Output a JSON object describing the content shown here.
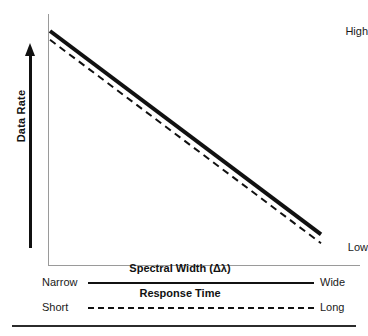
{
  "chart_data": {
    "type": "line",
    "title": "",
    "xlabel": "Spectral Width (Δλ)",
    "ylabel": "Data Rate",
    "grid": false,
    "legend": "none",
    "xlim": [
      0,
      1
    ],
    "ylim": [
      0,
      1
    ],
    "x_tick_labels": [
      "Narrow",
      "Wide"
    ],
    "y_tick_labels": [
      "Low",
      "High"
    ],
    "annotations": [
      "Data Rate decreases as Spectral Width increases",
      "Data Rate decreases as Response Time lengthens"
    ],
    "series": [
      {
        "name": "Spectral Width (Δλ)",
        "style": "solid",
        "color": "#111111",
        "width": 4,
        "x": [
          0.0,
          1.0
        ],
        "values": [
          1.0,
          0.08
        ]
      },
      {
        "name": "Response Time",
        "style": "dashed",
        "color": "#111111",
        "width": 2,
        "x": [
          0.0,
          1.0
        ],
        "values": [
          0.96,
          0.04
        ]
      }
    ],
    "scales": [
      {
        "name": "Spectral Width (Δλ)",
        "left_label": "Narrow",
        "right_label": "Wide",
        "line_style": "solid"
      },
      {
        "name": "Response Time",
        "left_label": "Short",
        "right_label": "Long",
        "line_style": "dashed"
      }
    ]
  },
  "yaxis": {
    "title": "Data Rate",
    "high_label": "High",
    "low_label": "Low",
    "arrow_direction": "up"
  },
  "xaxis": {
    "title": "Spectral Width (Δλ)",
    "left_label": "Narrow",
    "right_label": "Wide"
  },
  "secondary_scale": {
    "title": "Response Time",
    "left_label": "Short",
    "right_label": "Long"
  },
  "colors": {
    "line": "#111111",
    "axis": "#9a9a9a",
    "text": "#1a1a1a",
    "rule": "#2b2b2b",
    "background": "#ffffff"
  }
}
